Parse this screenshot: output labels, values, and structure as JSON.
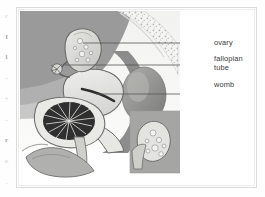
{
  "figure": {
    "illustration_style": "grayscale medical line-and-tone illustration"
  },
  "labels": [
    {
      "id": "ovary",
      "text": "ovary",
      "leader_y": 38,
      "target": "ovary"
    },
    {
      "id": "fallopian",
      "text": "fallopian\ntube",
      "leader_y": 54,
      "target": "fallopian-tube"
    },
    {
      "id": "womb",
      "text": "womb",
      "leader_y": 80,
      "target": "womb"
    }
  ],
  "inset": {
    "name": "magnified-ovary-inset",
    "depicts": "ovary"
  },
  "anatomy_parts": [
    "ovary",
    "fallopian tube",
    "womb",
    "cervix",
    "vagina",
    "bladder",
    "rectum",
    "pubic bone",
    "sacrum",
    "labia"
  ],
  "edge_artifacts": [
    "r",
    "I",
    "l",
    "-",
    "+",
    "-",
    "r",
    "e",
    "."
  ],
  "colors": {
    "page_background": "#fefefe",
    "frame_border": "#dcdcdc",
    "label_text": "#3b3b3b",
    "leader_line": "#555555",
    "tissue_mid_gray": "#9a9a9a",
    "tissue_dark_gray": "#7d7d7d",
    "tissue_light": "#e3e3e1",
    "rectum_dark": "#2f2f2f",
    "bone_stipple": "#b9b9b7"
  }
}
